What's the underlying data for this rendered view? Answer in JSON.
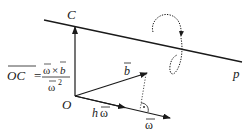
{
  "diagram": {
    "labels": {
      "point_c": "C",
      "point_o": "O",
      "line_p": "p",
      "vector_b": "b",
      "vector_h_omega_h": "h",
      "vector_h_omega_omega": "ω",
      "vector_omega": "ω"
    },
    "formula": {
      "lhs": "OC",
      "equals": "=",
      "numerator_omega": "ω",
      "numerator_times": "×",
      "numerator_b": "b",
      "denominator_omega": "ω",
      "denominator_exp": "2"
    },
    "colors": {
      "stroke": "#1a1a1a",
      "background": "#ffffff"
    }
  }
}
